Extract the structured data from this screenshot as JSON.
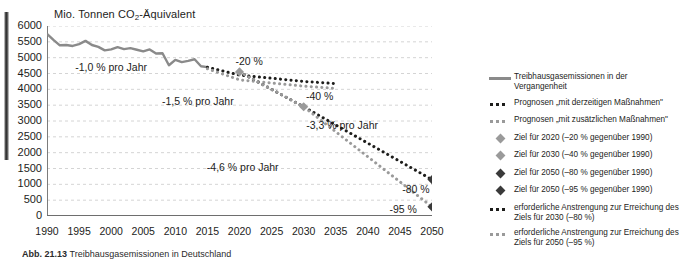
{
  "chart_data": {
    "type": "line",
    "title": "",
    "ylabel": "Mio. Tonnen CO2-Äquivalent",
    "xlabel": "",
    "ylim": [
      0,
      6000
    ],
    "xlim": [
      1990,
      2050
    ],
    "grid": true,
    "y_ticks": [
      "6000",
      "5500",
      "5000",
      "4500",
      "4000",
      "3500",
      "3000",
      "2500",
      "2000",
      "1500",
      "1000",
      "500",
      "0"
    ],
    "y_tick_values": [
      6000,
      5500,
      5000,
      4500,
      4000,
      3500,
      3000,
      2500,
      2000,
      1500,
      1000,
      500,
      0
    ],
    "x_ticks": [
      "1990",
      "1995",
      "2000",
      "2005",
      "2010",
      "2015",
      "2020",
      "2025",
      "2030",
      "2035",
      "2040",
      "2045",
      "2050"
    ],
    "x_tick_values": [
      1990,
      1995,
      2000,
      2005,
      2010,
      2015,
      2020,
      2025,
      2030,
      2035,
      2040,
      2045,
      2050
    ],
    "series": [
      {
        "name": "Treibhausgasemissionen in der Vergangenheit",
        "style": "solid",
        "color": "#8a8a8a",
        "x": [
          1990,
          1991,
          1992,
          1993,
          1994,
          1995,
          1996,
          1997,
          1998,
          1999,
          2000,
          2001,
          2002,
          2003,
          2004,
          2005,
          2006,
          2007,
          2008,
          2009,
          2010,
          2011,
          2012,
          2013,
          2014,
          2015
        ],
        "y": [
          5750,
          5560,
          5390,
          5400,
          5370,
          5430,
          5530,
          5400,
          5340,
          5230,
          5260,
          5330,
          5270,
          5300,
          5250,
          5200,
          5260,
          5130,
          5140,
          4760,
          4930,
          4860,
          4900,
          4950,
          4730,
          4700
        ]
      },
      {
        "name": "Prognosen \"mit derzeitigen Maßnahmen\"",
        "style": "dotted",
        "color": "#1d1d1b",
        "x": [
          2015,
          2020,
          2025,
          2030,
          2035
        ],
        "y": [
          4700,
          4450,
          4350,
          4250,
          4180
        ]
      },
      {
        "name": "Prognosen \"mit zusätzlichen Maßnahmen\"",
        "style": "dotted",
        "color": "#9a9a9a",
        "x": [
          2015,
          2020,
          2025,
          2030,
          2035
        ],
        "y": [
          4650,
          4300,
          4200,
          4100,
          4030
        ]
      },
      {
        "name": "erforderliche Anstrengung zur Erreichung des Ziels für 2030 (-80 %)",
        "style": "dotted",
        "color": "#1d1d1b",
        "x": [
          2020,
          2030,
          2050
        ],
        "y": [
          4550,
          3450,
          1150
        ]
      },
      {
        "name": "erforderliche Anstrengung zur Erreichung des Ziels für 2050 (-95 %)",
        "style": "dotted",
        "color": "#9a9a9a",
        "x": [
          2020,
          2030,
          2050
        ],
        "y": [
          4550,
          3450,
          290
        ]
      }
    ],
    "markers": [
      {
        "label": "Ziel für 2020",
        "x": 2020,
        "y": 4550,
        "color": "#9a9a9a",
        "data_label": "-20 %"
      },
      {
        "label": "Ziel für 2030",
        "x": 2030,
        "y": 3450,
        "color": "#9a9a9a",
        "data_label": "-40 %"
      },
      {
        "label": "Ziel für 2050 (-80 %)",
        "x": 2050,
        "y": 1150,
        "color": "#3a3a3a",
        "data_label": "-80 %"
      },
      {
        "label": "Ziel für 2050 (-95 %)",
        "x": 2050,
        "y": 290,
        "color": "#3a3a3a",
        "data_label": "-95 %"
      }
    ],
    "annotations": [
      {
        "text": "-1,0 % pro Jahr",
        "x": 2000,
        "y": 4700
      },
      {
        "text": "-1,5 % pro Jahr",
        "x": 2013.5,
        "y": 3620
      },
      {
        "text": "-3,3 % pro Jahr",
        "x": 2036,
        "y": 2870
      },
      {
        "text": "-4,6 % pro Jahr",
        "x": 2020.5,
        "y": 1540
      },
      {
        "text": "-20 %",
        "x": 2021.5,
        "y": 4900
      },
      {
        "text": "-40 %",
        "x": 2032.5,
        "y": 3790
      },
      {
        "text": "-80 %",
        "x": 2047.5,
        "y": 860
      },
      {
        "text": "-95 %",
        "x": 2045.5,
        "y": 230
      }
    ],
    "legend_position": "right"
  },
  "axis": {
    "y_title_pre": "Mio. Tonnen CO",
    "y_title_sub": "2",
    "y_title_post": "-Äquivalent"
  },
  "legend": {
    "items": [
      {
        "symbol": "solid-line",
        "color": "#8a8a8a",
        "label": "Treibhausgasemissionen in der Vergangenheit"
      },
      {
        "symbol": "dotted-line-dark",
        "color": "#1d1d1b",
        "label": "Prognosen „mit derzeitigen Maßnahmen\""
      },
      {
        "symbol": "dotted-line-gray",
        "color": "#9a9a9a",
        "label": "Prognosen „mit zusätzlichen Maßnahmen\""
      },
      {
        "symbol": "diamond-gray",
        "color": "#9a9a9a",
        "label": "Ziel für 2020 (–20 % gegenüber 1990)"
      },
      {
        "symbol": "diamond-gray",
        "color": "#9a9a9a",
        "label": "Ziel für 2030 (–40 % gegenüber 1990)"
      },
      {
        "symbol": "diamond-dark",
        "color": "#3a3a3a",
        "label": "Ziel für 2050 (–80 % gegenüber 1990)"
      },
      {
        "symbol": "diamond-dark",
        "color": "#3a3a3a",
        "label": "Ziel für 2050 (–95 % gegenüber 1990)"
      },
      {
        "symbol": "dotted-line-dark",
        "color": "#1d1d1b",
        "label": "erforderliche Anstrengung zur Erreichung des Ziels für 2030 (–80 %)"
      },
      {
        "symbol": "dotted-line-gray",
        "color": "#9a9a9a",
        "label": "erforderliche Anstrengung zur Erreichung des Ziels für 2050 (–95 %)"
      }
    ]
  },
  "caption": {
    "figure_number": "Abb. 21.13",
    "text": "Treibhausgasemissionen in Deutschland"
  }
}
